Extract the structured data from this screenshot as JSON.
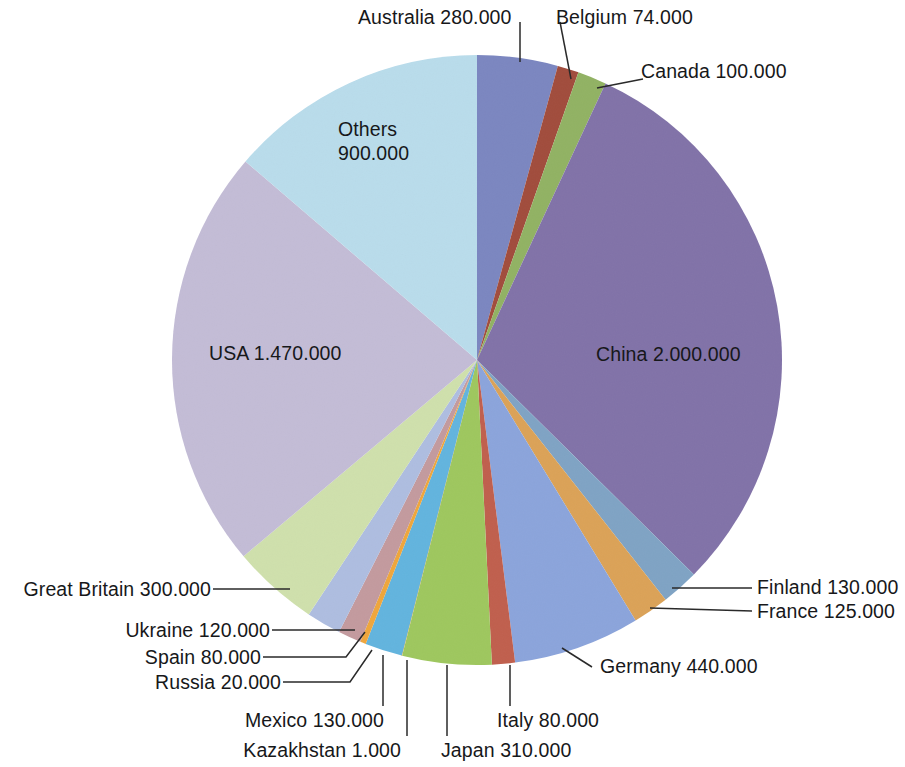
{
  "chart_data": {
    "type": "pie",
    "title": "",
    "units": "",
    "total": 6040000,
    "number_format": "dot-thousands",
    "legend": "none (direct labels with leader lines)",
    "start_angle_deg": 0,
    "direction": "clockwise",
    "categories": [
      "Australia",
      "Belgium",
      "Canada",
      "China",
      "Finland",
      "France",
      "Germany",
      "Italy",
      "Japan",
      "Kazakhstan",
      "Mexico",
      "Russia",
      "Spain",
      "Ukraine",
      "Great Britain",
      "USA",
      "Others"
    ],
    "values": [
      280000,
      74000,
      100000,
      2000000,
      130000,
      125000,
      440000,
      80000,
      310000,
      1000,
      130000,
      20000,
      80000,
      120000,
      300000,
      1470000,
      900000
    ],
    "value_labels": [
      "280.000",
      "74.000",
      "100.000",
      "2.000.000",
      "130.000",
      "125.000",
      "440.000",
      "80.000",
      "310.000",
      "1.000",
      "130.000",
      "20.000",
      "80.000",
      "120.000",
      "300.000",
      "1.470.000",
      "900.000"
    ],
    "colors": [
      "#7b86c0",
      "#a14c3c",
      "#91b263",
      "#8172a8",
      "#7fa3c4",
      "#dba257",
      "#8ba4db",
      "#c05f4d",
      "#9ec75e",
      "#f0c060",
      "#62b4de",
      "#efa63c",
      "#c39a9e",
      "#aebde0",
      "#cfe0ac",
      "#c3bcd6",
      "#b9dceb"
    ],
    "slices": [
      {
        "name": "Australia",
        "label": "Australia 280.000",
        "value": 280000,
        "value_label": "280.000",
        "color": "#7b86c0"
      },
      {
        "name": "Belgium",
        "label": "Belgium 74.000",
        "value": 74000,
        "value_label": "74.000",
        "color": "#a14c3c"
      },
      {
        "name": "Canada",
        "label": "Canada 100.000",
        "value": 100000,
        "value_label": "100.000",
        "color": "#91b263"
      },
      {
        "name": "China",
        "label": "China 2.000.000",
        "value": 2000000,
        "value_label": "2.000.000",
        "color": "#8172a8"
      },
      {
        "name": "Finland",
        "label": "Finland 130.000",
        "value": 130000,
        "value_label": "130.000",
        "color": "#7fa3c4"
      },
      {
        "name": "France",
        "label": "France 125.000",
        "value": 125000,
        "value_label": "125.000",
        "color": "#dba257"
      },
      {
        "name": "Germany",
        "label": "Germany 440.000",
        "value": 440000,
        "value_label": "440.000",
        "color": "#8ba4db"
      },
      {
        "name": "Italy",
        "label": "Italy 80.000",
        "value": 80000,
        "value_label": "80.000",
        "color": "#c05f4d"
      },
      {
        "name": "Japan",
        "label": "Japan 310.000",
        "value": 310000,
        "value_label": "310.000",
        "color": "#9ec75e"
      },
      {
        "name": "Kazakhstan",
        "label": "Kazakhstan 1.000",
        "value": 1000,
        "value_label": "1.000",
        "color": "#f0c060"
      },
      {
        "name": "Mexico",
        "label": "Mexico 130.000",
        "value": 130000,
        "value_label": "130.000",
        "color": "#62b4de"
      },
      {
        "name": "Russia",
        "label": "Russia 20.000",
        "value": 20000,
        "value_label": "20.000",
        "color": "#efa63c"
      },
      {
        "name": "Spain",
        "label": "Spain 80.000",
        "value": 80000,
        "value_label": "80.000",
        "color": "#c39a9e"
      },
      {
        "name": "Ukraine",
        "label": "Ukraine 120.000",
        "value": 120000,
        "value_label": "120.000",
        "color": "#aebde0"
      },
      {
        "name": "Great Britain",
        "label": "Great Britain 300.000",
        "value": 300000,
        "value_label": "300.000",
        "color": "#cfe0ac"
      },
      {
        "name": "USA",
        "label": "USA 1.470.000",
        "value": 1470000,
        "value_label": "1.470.000",
        "color": "#c3bcd6"
      },
      {
        "name": "Others",
        "label": "Others 900.000",
        "value": 900000,
        "value_label": "900.000",
        "color": "#b9dceb"
      }
    ]
  },
  "labels": {
    "australia": "Australia 280.000",
    "belgium": "Belgium 74.000",
    "canada": "Canada 100.000",
    "china": "China 2.000.000",
    "finland": "Finland 130.000",
    "france": "France 125.000",
    "germany": "Germany 440.000",
    "italy": "Italy 80.000",
    "japan": "Japan 310.000",
    "kazakhstan": "Kazakhstan 1.000",
    "mexico": "Mexico 130.000",
    "russia": "Russia 20.000",
    "spain": "Spain 80.000",
    "ukraine": "Ukraine 120.000",
    "great_britain": "Great Britain 300.000",
    "usa": "USA 1.470.000",
    "others_name": "Others",
    "others_value": "900.000"
  }
}
